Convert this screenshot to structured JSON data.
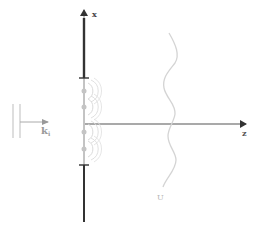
{
  "diagram": {
    "axes": {
      "x_label": "x",
      "z_label": "z"
    },
    "incident_wave": {
      "label_main": "k",
      "label_sub": "i"
    },
    "screen_wave": {
      "label": "U"
    },
    "holes": [
      {
        "y": 91
      },
      {
        "y": 107
      },
      {
        "y": 131
      },
      {
        "y": 148
      }
    ],
    "colors": {
      "axis": "#555555",
      "barrier": "#333333",
      "light_stroke": "#cccccc",
      "hole": "#bbbbbb",
      "label_light": "#aaaaaa"
    }
  }
}
